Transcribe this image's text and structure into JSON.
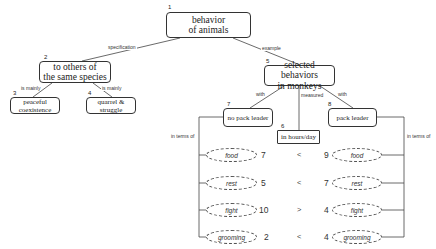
{
  "nodes": {
    "n1": {
      "num": "1",
      "label": "behavior\nof animals"
    },
    "n2": {
      "num": "2",
      "label": "to others of\nthe same species"
    },
    "n3": {
      "num": "3",
      "label": "peaceful\ncoexistence"
    },
    "n4": {
      "num": "4",
      "label": "quarrel &\nstruggle"
    },
    "n5": {
      "num": "5",
      "label": "selected behaviors\nin monkeys"
    },
    "n6": {
      "num": "6",
      "label": "in hours/day"
    },
    "n7": {
      "num": "7",
      "label": "no pack leader"
    },
    "n8": {
      "num": "8",
      "label": "pack leader"
    }
  },
  "edges": {
    "specification": "specification",
    "example": "example",
    "is_mainly_3": "is mainly",
    "is_mainly_4": "is mainly",
    "with_7": "with",
    "with_8": "with",
    "measured": "measured",
    "in_terms_of_left": "in terms of",
    "in_terms_of_right": "in terms of"
  },
  "comparison": {
    "rows": [
      {
        "behavior": "food",
        "no_pack_leader": "7",
        "operator": "<",
        "pack_leader": "9"
      },
      {
        "behavior": "rest",
        "no_pack_leader": "5",
        "operator": "<",
        "pack_leader": "7"
      },
      {
        "behavior": "fight",
        "no_pack_leader": "10",
        "operator": ">",
        "pack_leader": "4"
      },
      {
        "behavior": "grooming",
        "no_pack_leader": "2",
        "operator": "<",
        "pack_leader": "4"
      }
    ]
  }
}
